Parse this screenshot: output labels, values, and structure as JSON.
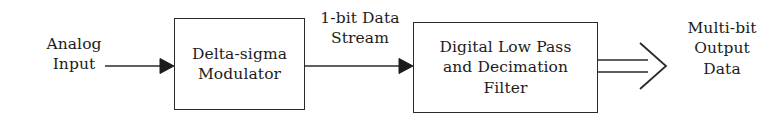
{
  "diagram": {
    "stroke_color": "#2a2a2a",
    "text_color": "#1c1c1c",
    "background_color": "#ffffff",
    "labels": {
      "input": "Analog\nInput",
      "intermediate": "1-bit Data\nStream",
      "output": "Multi-bit\nOutput\nData"
    },
    "blocks": [
      {
        "id": "modulator",
        "text": "Delta-sigma\nModulator"
      },
      {
        "id": "filter",
        "text": "Digital Low Pass\nand Decimation\nFilter"
      }
    ],
    "connectors": [
      {
        "id": "input-arrow",
        "style": "solid-arrowhead",
        "from": "analog-input-label",
        "to": "modulator"
      },
      {
        "id": "intermediate-arrow",
        "style": "solid-arrowhead",
        "from": "modulator",
        "to": "filter"
      },
      {
        "id": "output-arrow",
        "style": "hollow-open-arrow",
        "from": "filter",
        "to": "output-label"
      }
    ]
  }
}
